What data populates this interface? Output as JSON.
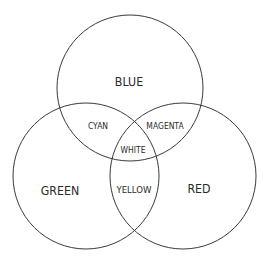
{
  "diagram": {
    "type": "venn",
    "stroke_color": "#3a3a3a",
    "background": "#ffffff",
    "circles": [
      {
        "name": "blue",
        "cx": 130,
        "cy": 88,
        "r": 73
      },
      {
        "name": "green",
        "cx": 86,
        "cy": 176,
        "r": 73
      },
      {
        "name": "red",
        "cx": 183,
        "cy": 176,
        "r": 73
      }
    ],
    "labels": {
      "blue": "BLUE",
      "green": "GREEN",
      "red": "RED",
      "cyan": "CYAN",
      "magenta": "MAGENTA",
      "yellow": "YELLOW",
      "white": "WHITE"
    }
  }
}
